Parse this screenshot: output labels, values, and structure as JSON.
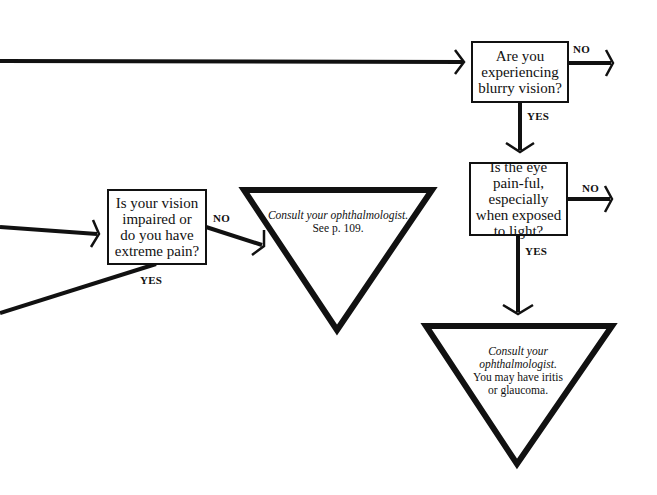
{
  "diagram": {
    "type": "flowchart",
    "colors": {
      "stroke": "#111111",
      "background": "#ffffff"
    },
    "questions": [
      {
        "id": "q_blurry",
        "text": "Are you experiencing blurry vision?"
      },
      {
        "id": "q_painful",
        "text": "Is the eye pain-ful, especially when exposed to light?"
      },
      {
        "id": "q_impaired",
        "text": "Is your vision impaired or do you have extreme pain?"
      }
    ],
    "outcomes": [
      {
        "id": "o_consult_109",
        "italic": "Consult your ophthalmologist.",
        "text": "See p. 109."
      },
      {
        "id": "o_consult_iritis",
        "italic": "Consult your ophthalmologist.",
        "text": "You may have iritis or glaucoma."
      }
    ],
    "labels": {
      "blurry_no": "NO",
      "blurry_yes": "YES",
      "painful_no": "NO",
      "painful_yes": "YES",
      "impaired_no": "NO",
      "impaired_yes": "YES"
    }
  }
}
